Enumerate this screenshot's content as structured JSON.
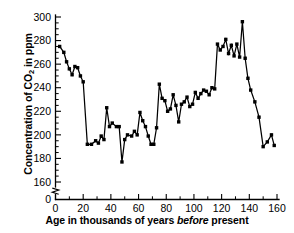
{
  "chart_data": {
    "type": "line",
    "title": "",
    "xlabel": "Age in thousands of years before present",
    "ylabel": "Concentration of CO2 in ppm",
    "ylabel_parts": {
      "pre": "Concentration of CO",
      "sub": "2",
      "post": " in ppm"
    },
    "xlabel_parts": {
      "pre": "Age in thousands of years ",
      "italic": "before",
      "post": " present"
    },
    "xlim": [
      0,
      160
    ],
    "ylim": [
      155,
      300
    ],
    "y_axis_break": true,
    "y_axis_break_note": "axis broken between 0 and 160",
    "grid": false,
    "legend": null,
    "xticks": [
      0,
      20,
      40,
      60,
      80,
      100,
      120,
      140,
      160
    ],
    "xtick_labels": [
      "0",
      "20",
      "40",
      "60",
      "80",
      "100",
      "120",
      "140",
      "160"
    ],
    "x_minor_step": 10,
    "yticks": [
      160,
      180,
      200,
      220,
      240,
      260,
      280,
      300
    ],
    "ytick_labels": [
      "160",
      "180",
      "200",
      "220",
      "240",
      "260",
      "280",
      "300"
    ],
    "y_zero_label": "0",
    "y_minor_step": 5,
    "marker": "square",
    "series": [
      {
        "name": "CO2 concentration",
        "color": "#000000",
        "x": [
          3,
          6,
          8,
          10,
          12,
          14,
          16,
          18,
          20,
          23,
          26,
          29,
          31,
          33,
          35,
          37,
          39,
          41,
          44,
          46,
          48,
          50,
          52,
          55,
          57,
          59,
          61,
          63,
          65,
          67,
          69,
          71,
          73,
          75,
          77,
          79,
          81,
          83,
          85,
          87,
          89,
          91,
          93,
          95,
          97,
          99,
          101,
          103,
          105,
          107,
          109,
          111,
          113,
          115,
          117,
          119,
          121,
          123,
          125,
          127,
          129,
          131,
          133,
          135,
          137,
          139,
          141,
          144,
          147,
          150,
          153,
          156,
          158
        ],
        "y": [
          275,
          270,
          262,
          256,
          251,
          258,
          257,
          250,
          245,
          192,
          192,
          195,
          193,
          199,
          196,
          223,
          207,
          210,
          207,
          207,
          177,
          196,
          200,
          199,
          203,
          200,
          219,
          212,
          207,
          199,
          192,
          192,
          206,
          243,
          231,
          229,
          220,
          222,
          234,
          225,
          211,
          226,
          228,
          232,
          224,
          226,
          236,
          231,
          235,
          238,
          237,
          234,
          240,
          239,
          277,
          272,
          275,
          281,
          269,
          276,
          267,
          277,
          266,
          296,
          265,
          248,
          238,
          228,
          215,
          190,
          194,
          200,
          191
        ]
      }
    ]
  }
}
